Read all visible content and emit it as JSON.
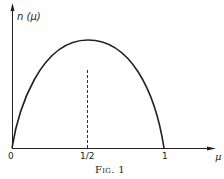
{
  "figure": {
    "caption": "Fig. 1",
    "y_axis_label": "n (μ)",
    "x_axis_label": "μ",
    "x_ticks": [
      "0",
      "1/2",
      "1"
    ]
  },
  "colors": {
    "ink": "#222222",
    "background": "#ffffff"
  },
  "curve": {
    "description": "concave arch from (0,0) peaking at μ=1/2 and returning to 0 at μ=1",
    "peak_x": "1/2",
    "guide": "dashed vertical line at μ=1/2"
  }
}
